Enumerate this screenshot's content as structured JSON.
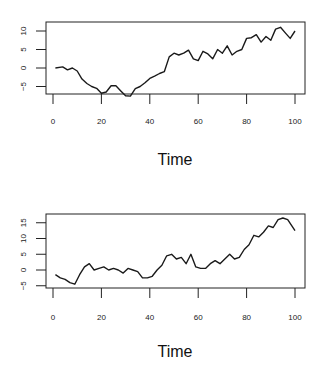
{
  "chart_data": [
    {
      "type": "line",
      "title": "",
      "xlabel": "Time",
      "ylabel": "",
      "xlim": [
        0,
        100
      ],
      "ylim": [
        -7.5,
        12
      ],
      "grid": false,
      "legend": null,
      "x_ticks": [
        0,
        20,
        40,
        60,
        80,
        100
      ],
      "y_ticks": [
        -5,
        0,
        5,
        10
      ],
      "x": [
        1,
        4,
        6,
        8,
        10,
        12,
        14,
        16,
        18,
        20,
        22,
        24,
        26,
        28,
        30,
        32,
        34,
        36,
        38,
        40,
        42,
        44,
        46,
        48,
        50,
        52,
        54,
        56,
        58,
        60,
        62,
        64,
        66,
        68,
        70,
        72,
        74,
        76,
        78,
        80,
        82,
        84,
        86,
        88,
        90,
        92,
        94,
        96,
        98,
        100
      ],
      "series": [
        {
          "name": "series1",
          "values": [
            0,
            0.3,
            -0.5,
            0,
            -0.8,
            -3,
            -4.2,
            -5,
            -5.5,
            -6.8,
            -6.5,
            -4.8,
            -4.8,
            -6.2,
            -7.5,
            -7.6,
            -5.6,
            -5,
            -4,
            -2.8,
            -2.2,
            -1.5,
            -1,
            3,
            4,
            3.5,
            4,
            4.8,
            2.5,
            2,
            4.5,
            3.8,
            2.5,
            5,
            4,
            6,
            3.5,
            4.5,
            5,
            8,
            8.2,
            9,
            7,
            8.5,
            7.5,
            10.5,
            11,
            9.5,
            8,
            10
          ]
        }
      ]
    },
    {
      "type": "line",
      "title": "",
      "xlabel": "Time",
      "ylabel": "",
      "xlim": [
        0,
        100
      ],
      "ylim": [
        -5.5,
        18
      ],
      "grid": false,
      "legend": null,
      "x_ticks": [
        0,
        20,
        40,
        60,
        80,
        100
      ],
      "y_ticks": [
        -5,
        0,
        5,
        10,
        15
      ],
      "x": [
        1,
        3,
        5,
        7,
        9,
        11,
        13,
        15,
        17,
        19,
        21,
        23,
        25,
        27,
        29,
        31,
        33,
        35,
        37,
        39,
        41,
        43,
        45,
        47,
        49,
        51,
        53,
        55,
        57,
        59,
        61,
        63,
        65,
        67,
        69,
        71,
        73,
        75,
        77,
        79,
        81,
        83,
        85,
        87,
        89,
        91,
        93,
        95,
        97,
        100
      ],
      "series": [
        {
          "name": "series2",
          "values": [
            -1.5,
            -2.5,
            -3,
            -4,
            -4.5,
            -1.5,
            1,
            2,
            0,
            0.5,
            1,
            0,
            0.5,
            0,
            -1,
            0.5,
            0,
            -0.5,
            -2.5,
            -2.5,
            -2,
            0,
            1.5,
            4.5,
            5,
            3.5,
            4,
            2,
            5,
            1,
            0.5,
            0.5,
            2,
            3,
            2,
            3.5,
            5,
            3.5,
            4,
            6.5,
            8,
            11,
            10.5,
            12,
            14,
            13.5,
            16,
            16.5,
            16,
            12.5
          ]
        }
      ]
    }
  ],
  "plots": [
    {
      "x_tick_labels": [
        "0",
        "20",
        "40",
        "60",
        "80",
        "100"
      ],
      "y_tick_labels": [
        "10",
        "5",
        "0",
        "-5"
      ],
      "xlabel": "Time"
    },
    {
      "x_tick_labels": [
        "0",
        "20",
        "40",
        "60",
        "80",
        "100"
      ],
      "y_tick_labels": [
        "15",
        "10",
        "5",
        "0",
        "-5"
      ],
      "xlabel": "Time"
    }
  ],
  "colors": {
    "line": "#1a1a1a",
    "axis": "#222222",
    "background": "#ffffff"
  }
}
